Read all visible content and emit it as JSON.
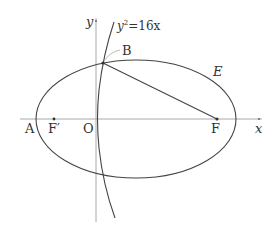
{
  "diagram": {
    "curves": {
      "parabola_label": "y²=16x",
      "parabola_base": "y",
      "parabola_exp": "2",
      "parabola_rest": "=16x",
      "ellipse_label": "E"
    },
    "points": {
      "A": "A",
      "F_prime": "F′",
      "O": "O",
      "F": "F",
      "B": "B"
    },
    "axes": {
      "x_label": "x",
      "y_label": "y"
    },
    "colors": {
      "stroke": "#444444",
      "axis": "#9a9a9a",
      "text": "#333333"
    }
  }
}
